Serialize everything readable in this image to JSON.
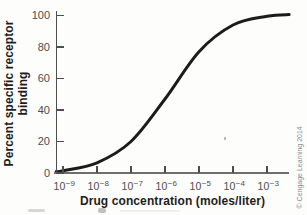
{
  "figure": {
    "credit": "© Cengage Learning 2014"
  },
  "chart_data": {
    "type": "line",
    "title": "",
    "xlabel": "Drug concentration (moles/liter)",
    "ylabel": "Percent specific receptor binding",
    "ylabel_lines": [
      "Percent specific receptor",
      "binding"
    ],
    "x_scale": "log10",
    "x_tick_base": "10",
    "x_tick_exponents_display": [
      "−9",
      "−8",
      "−7",
      "−6",
      "−5",
      "−4",
      "−3"
    ],
    "x_tick_exponent_values": [
      -9,
      -8,
      -7,
      -6,
      -5,
      -4,
      -3
    ],
    "y_ticks": [
      0,
      20,
      40,
      60,
      80,
      100
    ],
    "xlim_log10": [
      -9.2,
      -2.35
    ],
    "ylim": [
      0,
      105
    ],
    "grid": false,
    "legend": null,
    "curve_color": "#1b1b1b",
    "series": [
      {
        "name": "percent specific receptor binding vs drug concentration",
        "points_log10x_percent": [
          [
            -9.2,
            0.9
          ],
          [
            -9.0,
            1.4
          ],
          [
            -8.0,
            6.5
          ],
          [
            -7.0,
            20
          ],
          [
            -6.0,
            47
          ],
          [
            -5.0,
            77
          ],
          [
            -4.0,
            94
          ],
          [
            -3.0,
            99.5
          ],
          [
            -2.35,
            100.6
          ]
        ]
      }
    ]
  }
}
